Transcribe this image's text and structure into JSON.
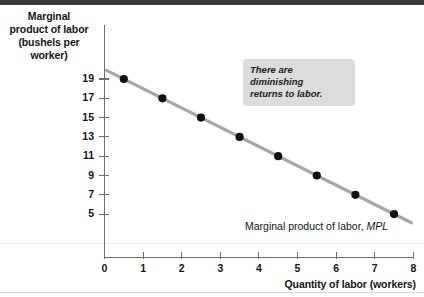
{
  "chart_data": {
    "type": "scatter",
    "title": "",
    "xlabel": "Quantity of labor (workers)",
    "ylabel": "Marginal product of labor (bushels per worker)",
    "ylabel_lines": [
      "Marginal",
      "product of labor",
      "(bushels per",
      "worker)"
    ],
    "x": [
      0.5,
      1.5,
      2.5,
      3.5,
      4.5,
      5.5,
      6.5,
      7.5
    ],
    "values": [
      19,
      17,
      15,
      13,
      11,
      9,
      7,
      5
    ],
    "series": [
      {
        "name": "Marginal product of labor, MPL",
        "x": [
          0.5,
          1.5,
          2.5,
          3.5,
          4.5,
          5.5,
          6.5,
          7.5
        ],
        "values": [
          19,
          17,
          15,
          13,
          11,
          9,
          7,
          5
        ]
      }
    ],
    "xlim": [
      0,
      8
    ],
    "ylim": [
      4,
      20
    ],
    "xticks": [
      "0",
      "1",
      "2",
      "3",
      "4",
      "5",
      "6",
      "7",
      "8"
    ],
    "yticks": [
      "19",
      "17",
      "15",
      "13",
      "11",
      "9",
      "7",
      "5"
    ],
    "ytick_values": [
      19,
      17,
      15,
      13,
      11,
      9,
      7,
      5
    ],
    "grid": false,
    "legend": "none",
    "line_color": "#a6a6a6",
    "point_color": "#111111",
    "annotations": [
      {
        "name": "diminishing-returns-callout",
        "lines": [
          "There are diminishing",
          "returns to labor."
        ],
        "text": "There are diminishing returns to labor.",
        "background": "#dcdcdc"
      },
      {
        "name": "series-curve-label",
        "text_prefix": "Marginal product of labor, ",
        "text_italic": "MPL"
      }
    ]
  },
  "axis": {
    "y_title_line1": "Marginal",
    "y_title_line2": "product of labor",
    "y_title_line3": "(bushels per",
    "y_title_line4": "worker)",
    "x_title": "Quantity of labor (workers)"
  },
  "callout": {
    "line1": "There are diminishing",
    "line2": "returns to labor."
  },
  "series_label": {
    "prefix": "Marginal product of labor, ",
    "italic": "MPL"
  }
}
